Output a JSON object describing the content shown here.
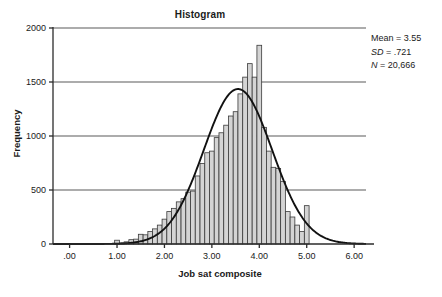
{
  "chart_data": {
    "type": "bar",
    "title": "Histogram",
    "xlabel": "Job sat composite",
    "ylabel": "Frequency",
    "xlim": [
      -0.35,
      6.25
    ],
    "ylim": [
      0,
      2000
    ],
    "grid": true,
    "ytick_values": [
      0,
      500,
      1000,
      1500,
      2000
    ],
    "ytick_labels": [
      "0",
      "500",
      "1000",
      "1500",
      "2000"
    ],
    "xtick_values": [
      0,
      1,
      2,
      3,
      4,
      5,
      6
    ],
    "xtick_labels": [
      ".00",
      "1.00",
      "2.00",
      "3.00",
      "4.00",
      "5.00",
      "6.00"
    ],
    "bin_width": 0.1,
    "bin_centers": [
      1.0,
      1.1,
      1.2,
      1.3,
      1.4,
      1.5,
      1.6,
      1.7,
      1.8,
      1.9,
      2.0,
      2.1,
      2.2,
      2.3,
      2.4,
      2.5,
      2.6,
      2.7,
      2.8,
      2.9,
      3.0,
      3.1,
      3.2,
      3.3,
      3.4,
      3.5,
      3.6,
      3.7,
      3.8,
      3.9,
      4.0,
      4.1,
      4.2,
      4.3,
      4.4,
      4.5,
      4.6,
      4.7,
      4.8,
      4.9,
      5.0
    ],
    "values": [
      35,
      10,
      20,
      40,
      45,
      90,
      85,
      115,
      140,
      175,
      230,
      300,
      330,
      390,
      420,
      480,
      490,
      630,
      745,
      845,
      860,
      985,
      1030,
      1100,
      1185,
      1225,
      1390,
      1545,
      1670,
      1545,
      1840,
      1080,
      860,
      710,
      700,
      580,
      300,
      250,
      175,
      115,
      355
    ],
    "curve": {
      "type": "normal",
      "mean": 3.55,
      "sd": 0.721,
      "n": 20666,
      "peak_value": 1435
    },
    "annotations": {
      "mean_label": "Mean = 3.55",
      "sd_symbol": "SD",
      "sd_value": " = .721",
      "n_symbol": "N",
      "n_value": " = 20,666"
    },
    "colors": {
      "bar_fill": "#d4d4d4",
      "bar_edge": "#3a3a3a",
      "curve": "#111111",
      "grid": "#5a5a5a",
      "axis": "#2b2b2b",
      "text": "#1a1a1a",
      "background": "#ffffff"
    }
  }
}
